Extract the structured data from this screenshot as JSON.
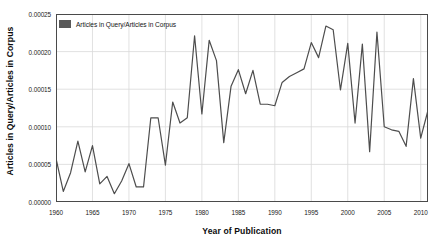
{
  "chart_data": {
    "type": "line",
    "title": "",
    "xlabel": "Year of Publication",
    "ylabel": "Articles in Query/Articles in Corpus",
    "legend": [
      "Articles in Query/Articles in Corpus"
    ],
    "legend_position": "top-left-inside",
    "grid": true,
    "xlim": [
      1960,
      2011
    ],
    "ylim": [
      0.0,
      0.00025
    ],
    "xticks": [
      1960,
      1965,
      1970,
      1975,
      1980,
      1985,
      1990,
      1995,
      2000,
      2005,
      2010
    ],
    "xtick_labels": [
      "1960",
      "1965",
      "1970",
      "1975",
      "1980",
      "1985",
      "1990",
      "1995",
      "2000",
      "2005",
      "2010"
    ],
    "yticks": [
      0.0,
      5e-05,
      0.0001,
      0.00015,
      0.0002,
      0.00025
    ],
    "ytick_labels": [
      "0.00000",
      "0.00005",
      "0.00010",
      "0.00015",
      "0.00020",
      "0.00025"
    ],
    "series": [
      {
        "name": "Articles in Query/Articles in Corpus",
        "color": "#4d4d4d",
        "x": [
          1960,
          1961,
          1962,
          1963,
          1964,
          1965,
          1966,
          1967,
          1968,
          1969,
          1970,
          1971,
          1972,
          1973,
          1974,
          1975,
          1976,
          1977,
          1978,
          1979,
          1980,
          1981,
          1982,
          1983,
          1984,
          1985,
          1986,
          1987,
          1988,
          1989,
          1990,
          1991,
          1992,
          1993,
          1994,
          1995,
          1996,
          1997,
          1998,
          1999,
          2000,
          2001,
          2002,
          2003,
          2004,
          2005,
          2006,
          2007,
          2008,
          2009,
          2010,
          2011
        ],
        "values": [
          5.8e-05,
          1.4e-05,
          3.9e-05,
          8.1e-05,
          4e-05,
          7.5e-05,
          2.4e-05,
          3.4e-05,
          1.1e-05,
          2.8e-05,
          5.1e-05,
          2e-05,
          2e-05,
          0.000112,
          0.000112,
          4.9e-05,
          0.000133,
          0.000105,
          0.000112,
          0.000221,
          0.000117,
          0.000215,
          0.000188,
          7.9e-05,
          0.000154,
          0.000176,
          0.000144,
          0.000175,
          0.00013,
          0.00013,
          0.000128,
          0.000159,
          0.000167,
          0.000172,
          0.000177,
          0.000212,
          0.000192,
          0.000234,
          0.000229,
          0.000149,
          0.000211,
          0.000105,
          0.00021,
          6.7e-05,
          0.000226,
          0.0001,
          9.6e-05,
          9.4e-05,
          7.4e-05,
          0.000164,
          8.5e-05,
          0.000122
        ]
      }
    ]
  },
  "legend": {
    "entry_label": "Articles in Query/Articles in Corpus",
    "swatch_color": "#595959"
  },
  "axes": {
    "x_title": "Year of Publication",
    "y_title": "Articles in Query/Articles in Corpus"
  },
  "colors": {
    "line": "#4d4d4d",
    "grid": "#d9d9d9",
    "frame": "#4a4a4a",
    "background": "#ffffff",
    "text": "#1a1a1a"
  }
}
